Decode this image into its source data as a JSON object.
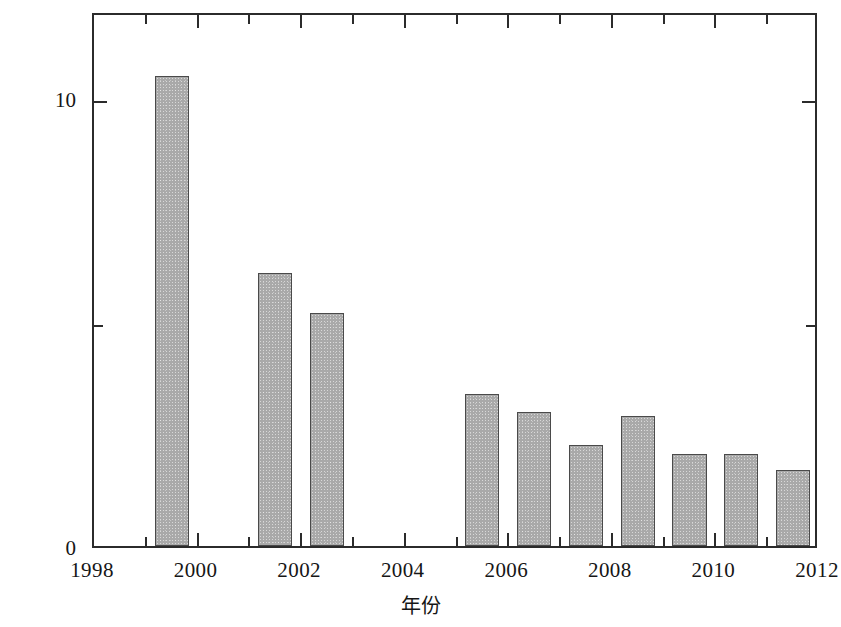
{
  "chart_data": {
    "type": "bar",
    "title": "",
    "subtitle": "",
    "xlabel": "年份",
    "ylabel": "基建拨款占总经费的比例(%)",
    "xlim": [
      1998,
      2012
    ],
    "ylim": [
      0,
      11.94
    ],
    "grid": false,
    "legend": null,
    "x_tick_labels": [
      "1998",
      "2000",
      "2002",
      "2004",
      "2006",
      "2008",
      "2010",
      "2012"
    ],
    "x_tick_values": [
      1998,
      2000,
      2002,
      2004,
      2006,
      2008,
      2010,
      2012
    ],
    "x_minor_ticks": [
      1999,
      2001,
      2003,
      2005,
      2007,
      2009,
      2011
    ],
    "y_tick_labels": [
      "0",
      "10"
    ],
    "y_tick_values": [
      0,
      10
    ],
    "y_minor_ticks": [
      5
    ],
    "categories": [
      1998,
      1999,
      2000,
      2001,
      2002,
      2003,
      2004,
      2005,
      2006,
      2007,
      2008,
      2009,
      2010,
      2011
    ],
    "values": [
      0,
      10.5,
      0,
      6.1,
      5.2,
      0,
      0,
      3.4,
      3.0,
      2.25,
      2.9,
      2.05,
      2.05,
      1.7
    ],
    "bars": [
      {
        "year": 1999,
        "value": 10.5
      },
      {
        "year": 2001,
        "value": 6.1
      },
      {
        "year": 2002,
        "value": 5.2
      },
      {
        "year": 2005,
        "value": 3.4
      },
      {
        "year": 2006,
        "value": 3.0
      },
      {
        "year": 2007,
        "value": 2.25
      },
      {
        "year": 2008,
        "value": 2.9
      },
      {
        "year": 2009,
        "value": 2.05
      },
      {
        "year": 2010,
        "value": 2.05
      },
      {
        "year": 2011,
        "value": 1.7
      }
    ],
    "bar_color": "#a9a9a9",
    "bar_edge_color": "#4a4a4a",
    "axis_color": "#2b2b2b",
    "background_color": "#ffffff",
    "bar_width_years": 0.66
  }
}
